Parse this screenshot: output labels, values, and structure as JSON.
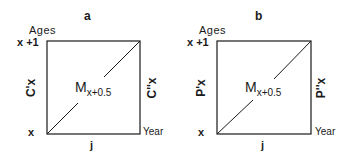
{
  "panels": [
    {
      "title": "a",
      "y_axis_label": "Ages",
      "top_age": "x +1",
      "bottom_age": "x",
      "x_axis_label": "Year",
      "bottom_label": "j",
      "center_label": "M",
      "center_subscript": "x+0.5",
      "left_side": "C'x",
      "right_side": "C''x"
    },
    {
      "title": "b",
      "y_axis_label": "Ages",
      "top_age": "x +1",
      "bottom_age": "x",
      "x_axis_label": "Year",
      "bottom_label": "j",
      "center_label": "M",
      "center_subscript": "x+0.5",
      "left_side": "P'x",
      "right_side": "P''x"
    }
  ]
}
